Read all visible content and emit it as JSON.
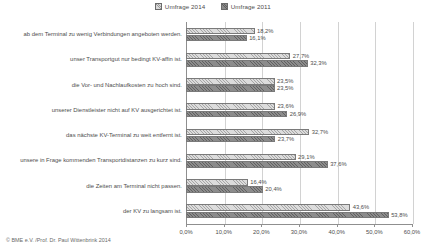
{
  "chart_data": {
    "type": "bar",
    "orientation": "horizontal",
    "title": "",
    "xlabel": "",
    "ylabel": "",
    "xlim": [
      0,
      60
    ],
    "grid": true,
    "legend_position": "top-center",
    "xticks": [
      "0,0%",
      "10,0%",
      "20,0%",
      "30,0%",
      "40,0%",
      "50,0%",
      "60,0%"
    ],
    "xtick_values": [
      0,
      10,
      20,
      30,
      40,
      50,
      60
    ],
    "categories": [
      "ab dem Terminal zu wenig Verbindungen angeboten werden.",
      "unser Transportgut nur bedingt KV-affin ist.",
      "die Vor- und Nachlaufkosten zu hoch sind.",
      "unserer Dienstleister nicht auf KV ausgerichtet ist.",
      "das nächste KV-Terminal zu weit entfernt ist.",
      "unsere in Frage kommenden Transportdistanzen zu kurz sind.",
      "die Zeiten am Terminal nicht passen.",
      "der KV zu langsam ist."
    ],
    "series": [
      {
        "name": "Umfrage 2014",
        "color": "#dcdcdc",
        "values": [
          18.2,
          27.7,
          23.5,
          23.6,
          32.7,
          29.1,
          16.4,
          43.6
        ],
        "labels": [
          "18,2%",
          "27,7%",
          "23,5%",
          "23,6%",
          "32,7%",
          "29,1%",
          "16,4%",
          "43,6%"
        ]
      },
      {
        "name": "Umfrage 2011",
        "color": "#8c8c8c",
        "values": [
          16.1,
          32.3,
          23.5,
          26.9,
          23.7,
          37.6,
          20.4,
          53.8
        ],
        "labels": [
          "16,1%",
          "32,3%",
          "23,5%",
          "26,9%",
          "23,7%",
          "37,6%",
          "20,4%",
          "53,8%"
        ]
      }
    ]
  },
  "footer": {
    "credit": "© BME e.V. /Prof. Dr. Paul Wittenbrink 2014"
  }
}
